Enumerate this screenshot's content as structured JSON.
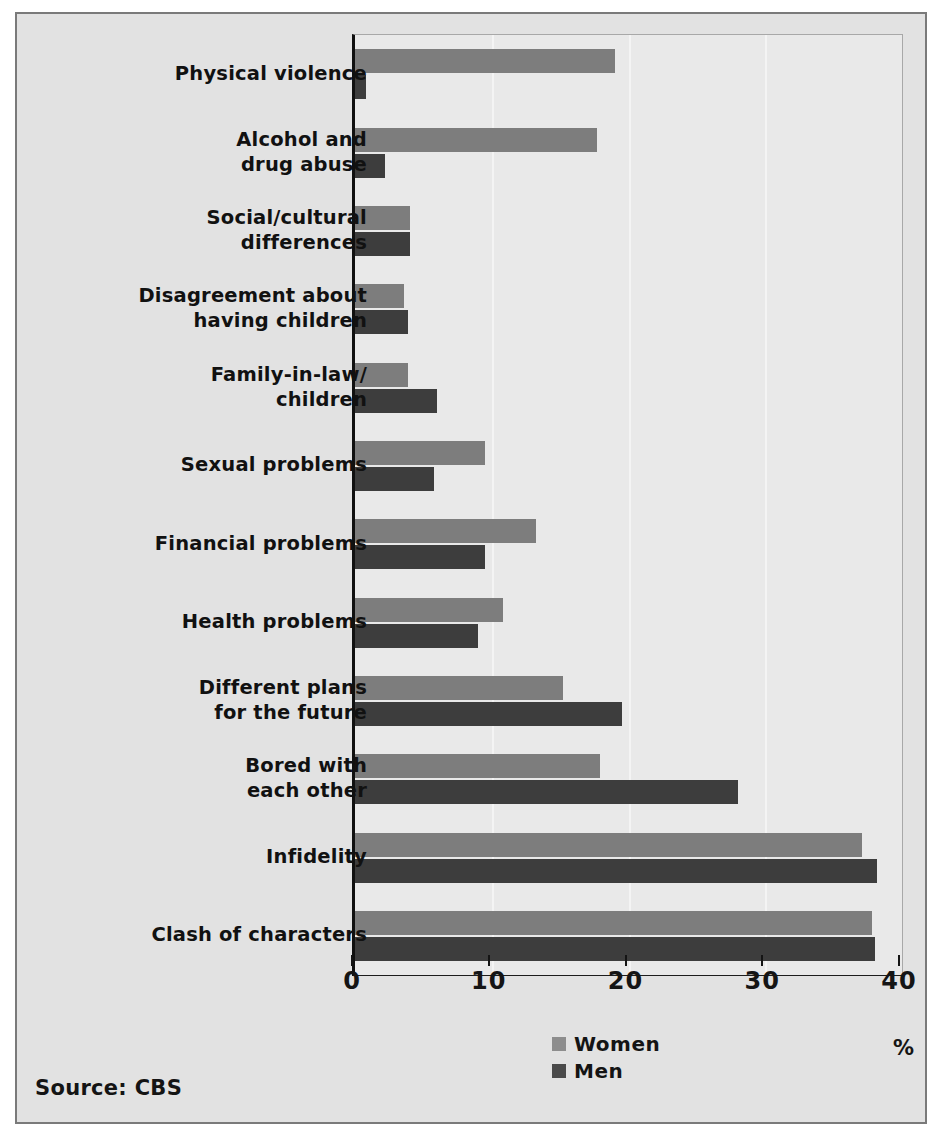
{
  "source_note": "Source: CBS",
  "unit_label": "%",
  "legend": [
    {
      "label": "Women",
      "color": "#8d8d8d"
    },
    {
      "label": "Men",
      "color": "#4a4a4a"
    }
  ],
  "axis": {
    "ticks": [
      "0",
      "10",
      "20",
      "30",
      "40"
    ]
  },
  "chart_data": {
    "type": "bar",
    "orientation": "horizontal",
    "title": "",
    "subtitle": "",
    "xlabel": "%",
    "ylabel": "",
    "xlim": [
      0,
      40
    ],
    "xticks": [
      0,
      10,
      20,
      30,
      40
    ],
    "grid": true,
    "legend_position": "bottom-center",
    "annotations": [
      "Source: CBS"
    ],
    "categories": [
      "Physical violence",
      "Alcohol and\ndrug abuse",
      "Social/cultural\ndifferences",
      "Disagreement about\nhaving children",
      "Family-in-law/\nchildren",
      "Sexual problems",
      "Financial problems",
      "Health problems",
      "Different plans\nfor the future",
      "Bored with\neach other",
      "Infidelity",
      "Clash of characters"
    ],
    "series": [
      {
        "name": "Women",
        "color": "#7d7d7d",
        "values": [
          19.0,
          17.7,
          4.0,
          3.6,
          3.9,
          9.5,
          13.2,
          10.8,
          15.2,
          17.9,
          37.1,
          37.8
        ]
      },
      {
        "name": "Men",
        "color": "#3d3d3d",
        "values": [
          0.8,
          2.2,
          4.0,
          3.9,
          6.0,
          5.8,
          9.5,
          9.0,
          19.5,
          28.0,
          38.2,
          38.0
        ]
      }
    ]
  }
}
